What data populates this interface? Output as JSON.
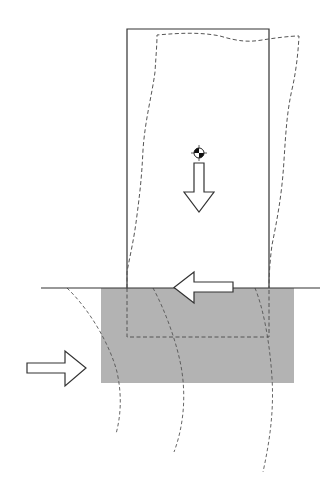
{
  "diagram": {
    "type": "structural-seismic-schematic",
    "colors": {
      "background": "#ffffff",
      "soil_block": "#b3b3b3",
      "lines": "#333333",
      "dashed_lines": "#555555"
    },
    "elements": {
      "column": {
        "label": "",
        "x": 127,
        "y": 29,
        "width": 142,
        "height": 259
      },
      "deformed_shape": {
        "label": "",
        "style": "dashed"
      },
      "ground_line": {
        "label": "",
        "x1": 41,
        "x2": 320,
        "y": 288
      },
      "soil_block": {
        "label": "",
        "x": 101,
        "y": 288,
        "width": 193,
        "height": 95
      },
      "foundation_outline": {
        "label": "",
        "x": 127,
        "y": 288,
        "width": 142,
        "height": 49,
        "style": "dashed"
      },
      "center_of_gravity": {
        "label": "",
        "cx": 199,
        "cy": 153
      },
      "gravity_arrow": {
        "label": "",
        "direction": "down"
      },
      "base_shear_arrow": {
        "label": "",
        "direction": "left"
      },
      "seismic_wave_arrow": {
        "label": "",
        "direction": "right"
      },
      "wave_fronts": {
        "count": 3,
        "style": "dashed-arcs"
      }
    }
  }
}
